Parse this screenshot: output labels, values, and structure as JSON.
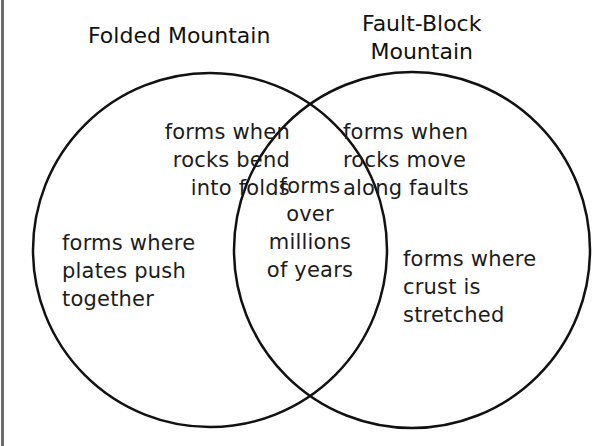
{
  "diagram": {
    "type": "venn",
    "sets": [
      {
        "title": "Folded Mountain",
        "items": [
          "forms when\nrocks bend\ninto folds",
          "forms where\nplates push\ntogether"
        ]
      },
      {
        "title": "Fault-Block\nMountain",
        "items": [
          "forms when\nrocks move\nalong faults",
          "forms where\ncrust is\nstretched"
        ]
      }
    ],
    "overlap": {
      "items": [
        "forms\nover\nmillions\nof years"
      ]
    },
    "colors": {
      "stroke": "#111111",
      "background": "#ffffff",
      "text": "#1c1c1c"
    }
  }
}
